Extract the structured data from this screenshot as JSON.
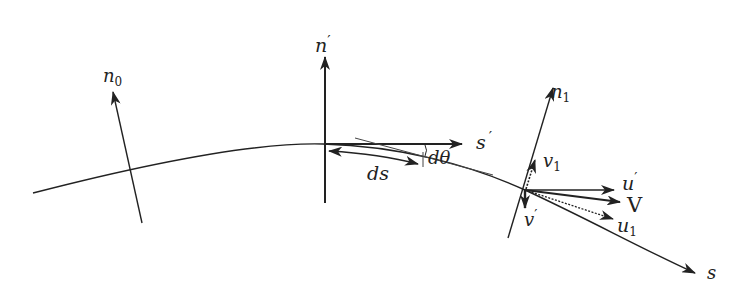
{
  "diagram": {
    "colors": {
      "stroke": "#222222",
      "background": "#ffffff"
    },
    "labels": {
      "n0": {
        "base": "n",
        "sub": "0"
      },
      "n_prime": {
        "base": "n",
        "prime": "′"
      },
      "s_prime": {
        "base": "s",
        "prime": "′"
      },
      "ds": "ds",
      "dtheta": "dθ",
      "n1": {
        "base": "n",
        "sub": "1"
      },
      "v1": {
        "base": "v",
        "sub": "1"
      },
      "u_prime": {
        "base": "u",
        "prime": "′"
      },
      "V": "V",
      "v_prime": {
        "base": "v",
        "prime": "′"
      },
      "u1": {
        "base": "u",
        "sub": "1"
      },
      "s": "s"
    }
  }
}
